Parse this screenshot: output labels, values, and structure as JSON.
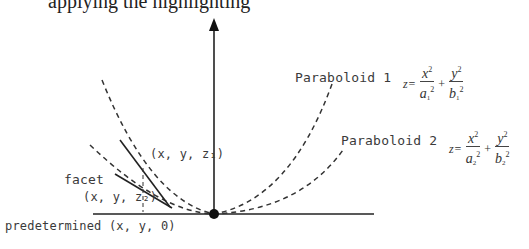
{
  "header": {
    "clipped_text": "applying the highlighting"
  },
  "diagram": {
    "axes": {
      "vertical_axis": "z-axis arrow",
      "horizontal_axis": "base plane line",
      "origin_point": "dot"
    },
    "curves": [
      {
        "name": "Paraboloid 1",
        "style": "dashed"
      },
      {
        "name": "Paraboloid 2",
        "style": "dashed"
      }
    ],
    "labels": {
      "paraboloid1": "Paraboloid 1",
      "paraboloid2": "Paraboloid 2",
      "point_z1": "(x, y, z₁)",
      "facet": "facet",
      "point_z2": "(x, y, z₂)",
      "predetermined": "predetermined (x, y, 0)"
    },
    "formula1": {
      "lhs": "z=",
      "x_num": "x",
      "x_den_base": "a",
      "x_den_sub": "1",
      "y_num": "y",
      "y_den_base": "b",
      "y_den_sub": "1",
      "exp": "2",
      "plus": "+"
    },
    "formula2": {
      "lhs": "z=",
      "x_num": "x",
      "x_den_base": "a",
      "x_den_sub": "2",
      "y_num": "y",
      "y_den_base": "b",
      "y_den_sub": "2",
      "exp": "2",
      "plus": "+"
    },
    "colors": {
      "line": "#1a1a1a",
      "dashed": "#333333",
      "text": "#3a3a3a"
    }
  }
}
